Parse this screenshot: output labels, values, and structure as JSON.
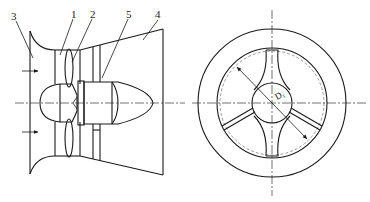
{
  "figure": {
    "side_view": {
      "callouts": [
        {
          "id": "3",
          "label": "3"
        },
        {
          "id": "1",
          "label": "1"
        },
        {
          "id": "2",
          "label": "2"
        },
        {
          "id": "5",
          "label": "5"
        },
        {
          "id": "4",
          "label": "4"
        }
      ],
      "flow_arrows": 2
    },
    "front_view": {
      "dimension_label": "D₁",
      "struts": 3
    }
  }
}
